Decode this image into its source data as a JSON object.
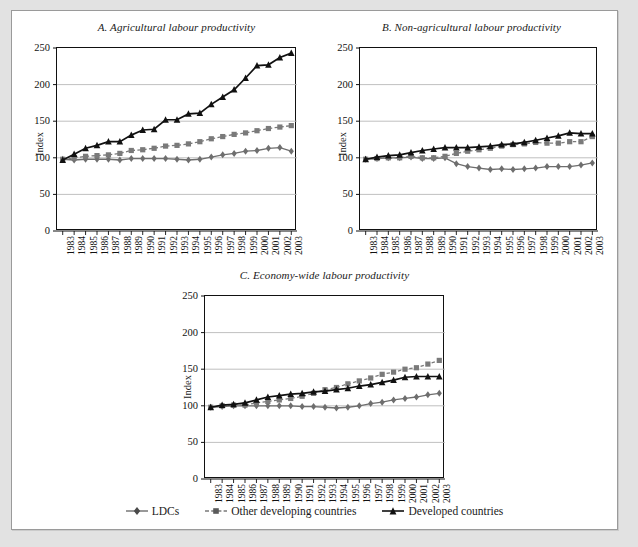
{
  "figure": {
    "background_color": "#ffffff",
    "frame_color": "#e2e2e2"
  },
  "legend": {
    "position": "bottom-center",
    "items": [
      {
        "label": "LDCs",
        "marker": "diamond",
        "color": "#6e6e6e",
        "line": "solid"
      },
      {
        "label": "Other developing countries",
        "marker": "square",
        "color": "#7a7a7a",
        "line": "dashed"
      },
      {
        "label": "Developed countries",
        "marker": "triangle",
        "color": "#111111",
        "line": "solid"
      }
    ]
  },
  "chart_data": [
    {
      "type": "line",
      "panel": "A",
      "title": "A. Agricultural labour productivity",
      "xlabel": "",
      "ylabel": "Index",
      "ylim": [
        0,
        250
      ],
      "yticks": [
        0,
        50,
        100,
        150,
        200,
        250
      ],
      "grid": true,
      "x": [
        "1983",
        "1984",
        "1985",
        "1986",
        "1987",
        "1988",
        "1989",
        "1990",
        "1991",
        "1992",
        "1993",
        "1994",
        "1995",
        "1996",
        "1997",
        "1998",
        "1999",
        "2000",
        "2001",
        "2002",
        "2003"
      ],
      "series": [
        {
          "name": "LDCs",
          "marker": "diamond",
          "color": "#6e6e6e",
          "line": "solid",
          "values": [
            98,
            97,
            98,
            98,
            98,
            97,
            99,
            99,
            99,
            99,
            98,
            97,
            98,
            101,
            104,
            106,
            109,
            110,
            113,
            114,
            109
          ]
        },
        {
          "name": "Other developing countries",
          "marker": "square",
          "color": "#7a7a7a",
          "line": "dashed",
          "values": [
            98,
            100,
            102,
            103,
            104,
            106,
            110,
            111,
            113,
            116,
            117,
            119,
            122,
            126,
            129,
            132,
            134,
            137,
            140,
            142,
            144
          ]
        },
        {
          "name": "Developed countries",
          "marker": "triangle",
          "color": "#111111",
          "line": "solid",
          "values": [
            97,
            105,
            113,
            117,
            122,
            122,
            131,
            138,
            139,
            152,
            152,
            160,
            161,
            173,
            183,
            193,
            209,
            226,
            227,
            237,
            243
          ]
        }
      ]
    },
    {
      "type": "line",
      "panel": "B",
      "title": "B. Non-agricultural labour productivity",
      "xlabel": "",
      "ylabel": "Index",
      "ylim": [
        0,
        250
      ],
      "yticks": [
        0,
        50,
        100,
        150,
        200,
        250
      ],
      "grid": true,
      "x": [
        "1983",
        "1984",
        "1985",
        "1986",
        "1987",
        "1988",
        "1989",
        "1990",
        "1991",
        "1992",
        "1993",
        "1994",
        "1995",
        "1996",
        "1997",
        "1998",
        "1999",
        "2000",
        "2001",
        "2002",
        "2003"
      ],
      "series": [
        {
          "name": "LDCs",
          "marker": "diamond",
          "color": "#6e6e6e",
          "line": "solid",
          "values": [
            98,
            99,
            100,
            100,
            101,
            99,
            99,
            100,
            92,
            88,
            86,
            84,
            85,
            84,
            85,
            86,
            88,
            88,
            88,
            90,
            93
          ]
        },
        {
          "name": "Other developing countries",
          "marker": "square",
          "color": "#7a7a7a",
          "line": "dashed",
          "values": [
            98,
            99,
            100,
            100,
            102,
            100,
            100,
            102,
            106,
            109,
            111,
            113,
            116,
            118,
            119,
            121,
            120,
            120,
            122,
            122,
            129
          ]
        },
        {
          "name": "Developed countries",
          "marker": "triangle",
          "color": "#111111",
          "line": "solid",
          "values": [
            98,
            101,
            103,
            104,
            107,
            110,
            112,
            114,
            114,
            114,
            115,
            116,
            118,
            119,
            121,
            124,
            127,
            130,
            134,
            133,
            133
          ]
        }
      ]
    },
    {
      "type": "line",
      "panel": "C",
      "title": "C. Economy-wide labour productivity",
      "xlabel": "",
      "ylabel": "Index",
      "ylim": [
        0,
        250
      ],
      "yticks": [
        0,
        50,
        100,
        150,
        200,
        250
      ],
      "grid": true,
      "x": [
        "1983",
        "1984",
        "1985",
        "1986",
        "1987",
        "1988",
        "1989",
        "1990",
        "1991",
        "1992",
        "1993",
        "1994",
        "1995",
        "1996",
        "1997",
        "1998",
        "1999",
        "2000",
        "2001",
        "2002",
        "2003"
      ],
      "series": [
        {
          "name": "LDCs",
          "marker": "diamond",
          "color": "#6e6e6e",
          "line": "solid",
          "values": [
            98,
            99,
            100,
            100,
            100,
            100,
            100,
            100,
            99,
            99,
            98,
            97,
            98,
            100,
            103,
            105,
            108,
            110,
            112,
            115,
            117
          ]
        },
        {
          "name": "Other developing countries",
          "marker": "square",
          "color": "#7a7a7a",
          "line": "dashed",
          "values": [
            98,
            100,
            101,
            101,
            104,
            106,
            108,
            110,
            113,
            117,
            122,
            125,
            130,
            134,
            138,
            143,
            146,
            150,
            152,
            157,
            162
          ]
        },
        {
          "name": "Developed countries",
          "marker": "triangle",
          "color": "#111111",
          "line": "solid",
          "values": [
            98,
            101,
            102,
            104,
            108,
            112,
            114,
            116,
            117,
            119,
            120,
            122,
            124,
            127,
            129,
            132,
            135,
            139,
            140,
            140,
            140
          ]
        }
      ]
    }
  ]
}
